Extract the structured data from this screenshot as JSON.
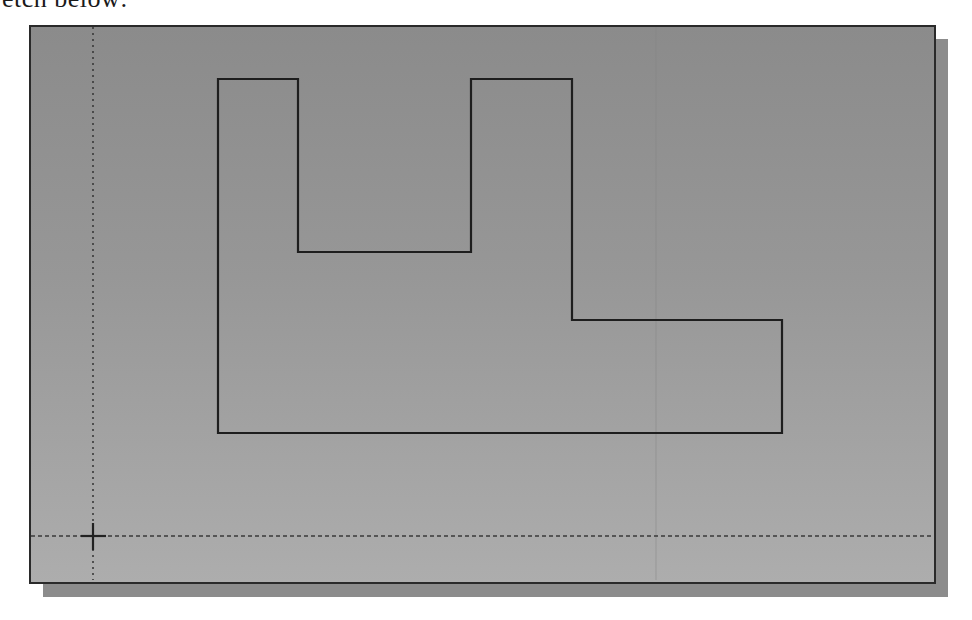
{
  "caption": {
    "text": "etch below:"
  },
  "viewport": {
    "background_top": "#8b8b8b",
    "background_bottom": "#adadad",
    "border_color": "#2a2a2a",
    "shadow_color": "#8c8c8c"
  },
  "axes": {
    "origin": {
      "x": 93,
      "y": 536
    },
    "vertical_axis_style": "dotted",
    "horizontal_axis_style": "dashed",
    "color": "#3a3a3a"
  },
  "sketch": {
    "name": "L-U profile outline",
    "stroke_color": "#1e1e1e",
    "vertices": [
      [
        218,
        79
      ],
      [
        298,
        79
      ],
      [
        298,
        252
      ],
      [
        471,
        252
      ],
      [
        471,
        79
      ],
      [
        572,
        79
      ],
      [
        572,
        320
      ],
      [
        782,
        320
      ],
      [
        782,
        433
      ],
      [
        218,
        433
      ]
    ],
    "closed": true
  }
}
